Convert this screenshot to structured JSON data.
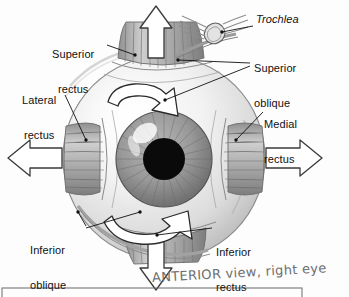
{
  "figure": {
    "handwritten_caption": "ANTERIOR view, right eye",
    "caption_color": "#6f6f6f"
  },
  "labels": [
    {
      "id": "superior-rectus",
      "line1": "Superior",
      "line2": "rectus",
      "style": "regular"
    },
    {
      "id": "trochlea",
      "line1": "Trochlea",
      "line2": "",
      "style": "italic"
    },
    {
      "id": "superior-oblique",
      "line1": "Superior",
      "line2": "oblique",
      "style": "regular"
    },
    {
      "id": "lateral-rectus",
      "line1": "Lateral",
      "line2": "rectus",
      "style": "regular"
    },
    {
      "id": "medial-rectus",
      "line1": "Medial",
      "line2": "rectus",
      "style": "regular"
    },
    {
      "id": "inferior-oblique",
      "line1": "Inferior",
      "line2": "oblique",
      "style": "regular"
    },
    {
      "id": "inferior-rectus",
      "line1": "Inferior",
      "line2": "rectus",
      "style": "regular"
    }
  ],
  "direction_arrows": [
    {
      "id": "up-arrow",
      "direction": "up",
      "muscle": "superior-rectus"
    },
    {
      "id": "down-arrow",
      "direction": "down",
      "muscle": "inferior-rectus"
    },
    {
      "id": "left-arrow",
      "direction": "left",
      "muscle": "lateral-rectus"
    },
    {
      "id": "right-arrow",
      "direction": "right",
      "muscle": "medial-rectus"
    }
  ],
  "rotation_arrows": [
    {
      "id": "superior-oblique-rotation",
      "position": "upper",
      "direction": "clockwise"
    },
    {
      "id": "inferior-oblique-rotation",
      "position": "lower",
      "direction": "counterclockwise"
    }
  ],
  "eye": {
    "sclera_color": "#e8e8e8",
    "iris_color": "#8d8d8d",
    "pupil_color": "#0a0a0a",
    "muscle_color": "#9a9a9a",
    "outline_color": "#3a3a3a"
  }
}
